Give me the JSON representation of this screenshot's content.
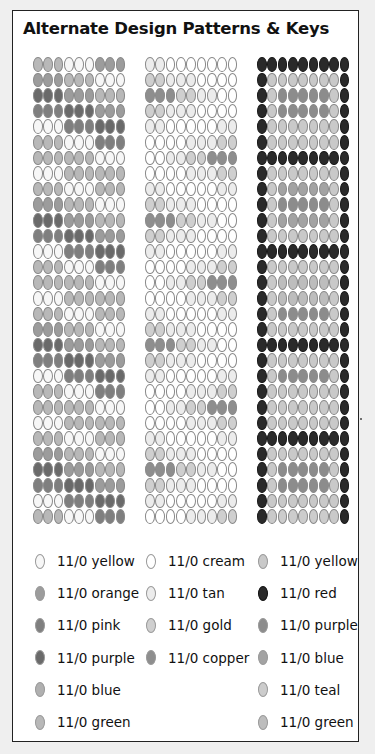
{
  "title": "Alternate Design Patterns & Keys",
  "colors": {
    "L_yellow": "#f7f7f7",
    "L_orange": "#9c9c9c",
    "L_pink": "#7f7f7f",
    "L_purple": "#6a6a6a",
    "L_blue": "#b0b0b0",
    "L_green": "#b8b8b8",
    "M_cream": "#ffffff",
    "M_tan": "#ececec",
    "M_gold": "#cfcfcf",
    "M_copper": "#8e8e8e",
    "R_yellow": "#c9c9c9",
    "R_red": "#2a2a2a",
    "R_purple": "#8c8c8c",
    "R_blue": "#a3a3a3",
    "R_teal": "#cccccc",
    "R_green": "#bdbdbd"
  },
  "patterns": {
    "left": {
      "columns": 9,
      "rows": [
        "GGGYYYOOO",
        "OOOGGGYYY",
        "UUUOOOGGG",
        "PPPUUUOOO",
        "YYYPPPUUU",
        "GGGYYYPPP",
        "GGGGGGYYY",
        "YYYGGGGGG",
        "GGGYYYGGG",
        "OOOGGGYYY",
        "UUUOOOGGG",
        "PPPUUUOOO",
        "YYYPPPUUU",
        "GGGYYYPPP",
        "GGGGGGYYY",
        "YYYGGGGGG",
        "GGGYYYGGG",
        "OOOGGGYYY",
        "UUUOOOGGG",
        "PPPUUUOOO",
        "YYYPPPUUU",
        "GGGYYYPPP",
        "GGGGGGYYY",
        "YYYGGGGGG",
        "GGGYYYGGG",
        "OOOGGGYYY",
        "UUUOOOGGG",
        "PPPUUUOOO",
        "YYYPPPUUU",
        "GGGYYYPPP"
      ],
      "key": {
        "Y": "L_yellow",
        "O": "L_orange",
        "P": "L_pink",
        "U": "L_purple",
        "B": "L_blue",
        "G": "L_green"
      }
    },
    "middle": {
      "columns": 9,
      "rows": [
        "ttccccccc",
        "ggtttcccc",
        "kkkggttcc",
        "ggtttcccc",
        "ttccccctt",
        "cccctttgg",
        "ccttggkkk",
        "cccctttgg",
        "ttccccctt",
        "ggtttcccc",
        "kkkggttcc",
        "ggtttcccc",
        "ttccccctt",
        "cccctttgg",
        "ccttggkkk",
        "cccctttgg",
        "ttccccctt",
        "ggtttcccc",
        "kkkggttcc",
        "ggtttcccc",
        "ttccccctt",
        "cccctttgg",
        "ccttggkkk",
        "cccctttgg",
        "ttccccctt",
        "ggtttcccc",
        "kkkggttcc",
        "ggtttcccc",
        "ttccccctt",
        "cccctttgg"
      ],
      "key": {
        "c": "M_cream",
        "t": "M_tan",
        "g": "M_gold",
        "k": "M_copper"
      }
    },
    "right": {
      "columns": 9,
      "rows": [
        "RRRRRRRRR",
        "RYYYYYYYR",
        "RYPPPPPYR",
        "RYPPPPPYR",
        "RYYYYYYYR",
        "RYYYYYYYR",
        "RRRRRRRRR",
        "RYYYYYYYR",
        "RYBBBBBYR",
        "RYPPPPPYR",
        "RYBBBBBYR",
        "RYYYYYYYR",
        "RRRRRRRRR",
        "RYYYYYYYR",
        "RYGGGGGYR",
        "RYGGGGGYR",
        "RYPPPPPYR",
        "RYYYYYYYR",
        "RRRRRRRRR",
        "RYYYYYYYR",
        "RYPPPPPYR",
        "RYYYYYYYR",
        "RYYYYYYYR",
        "RYYYYYYYR",
        "RRRRRRRRR",
        "RYYYYYYYR",
        "RYPPPPPYR",
        "RYPPPPPYR",
        "RYYYYYYYR",
        "RYTTTTTYR"
      ],
      "key": {
        "R": "R_red",
        "Y": "R_yellow",
        "P": "R_purple",
        "B": "R_blue",
        "T": "R_teal",
        "G": "R_green"
      }
    }
  },
  "legend": {
    "left": [
      {
        "label": "11/0 yellow",
        "color": "L_yellow"
      },
      {
        "label": "11/0 orange",
        "color": "L_orange"
      },
      {
        "label": "11/0 pink",
        "color": "L_pink"
      },
      {
        "label": "11/0 purple",
        "color": "L_purple"
      },
      {
        "label": "11/0 blue",
        "color": "L_blue"
      },
      {
        "label": "11/0 green",
        "color": "L_green"
      }
    ],
    "middle": [
      {
        "label": "11/0 cream",
        "color": "M_cream"
      },
      {
        "label": "11/0 tan",
        "color": "M_tan"
      },
      {
        "label": "11/0 gold",
        "color": "M_gold"
      },
      {
        "label": "11/0 copper",
        "color": "M_copper"
      }
    ],
    "right": [
      {
        "label": "11/0 yellow",
        "color": "R_yellow"
      },
      {
        "label": "11/0 red",
        "color": "R_red"
      },
      {
        "label": "11/0 purple",
        "color": "R_purple"
      },
      {
        "label": "11/0 blue",
        "color": "R_blue"
      },
      {
        "label": "11/0 teal",
        "color": "R_teal"
      },
      {
        "label": "11/0 green",
        "color": "R_green"
      }
    ]
  }
}
